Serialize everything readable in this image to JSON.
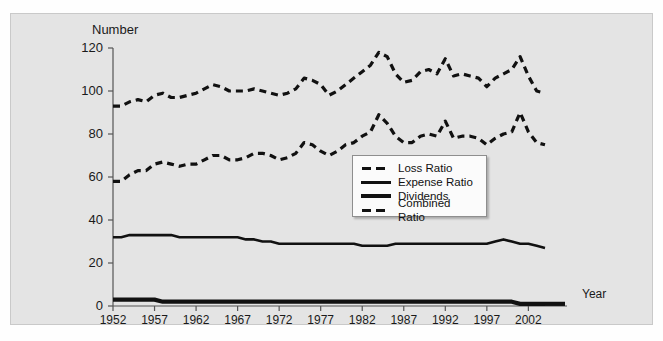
{
  "axes": {
    "y_title": "Number",
    "x_title": "Year",
    "yticks": [
      "0",
      "20",
      "40",
      "60",
      "80",
      "100",
      "120"
    ],
    "xticks": [
      "1952",
      "1957",
      "1962",
      "1967",
      "1972",
      "1977",
      "1982",
      "1987",
      "1992",
      "1997",
      "2002"
    ]
  },
  "legend": {
    "items": [
      {
        "label": "Loss Ratio",
        "key": "dashed"
      },
      {
        "label": "Expense Ratio",
        "key": "solid"
      },
      {
        "label": "Dividends",
        "key": "thick"
      },
      {
        "label": "Combined Ratio",
        "key": "dashed"
      }
    ]
  },
  "colors": {
    "ink": "#111111",
    "panel": "#e4e4e4",
    "legend_bg": "#fbfbfb",
    "axis": "#555555"
  },
  "chart_data": {
    "type": "line",
    "title": "",
    "xlabel": "Year",
    "ylabel": "Number",
    "ylim": [
      0,
      120
    ],
    "xlim": [
      1952,
      2004
    ],
    "grid": false,
    "legend_position": "center",
    "x": [
      1952,
      1953,
      1954,
      1955,
      1956,
      1957,
      1958,
      1959,
      1960,
      1961,
      1962,
      1963,
      1964,
      1965,
      1966,
      1967,
      1968,
      1969,
      1970,
      1971,
      1972,
      1973,
      1974,
      1975,
      1976,
      1977,
      1978,
      1979,
      1980,
      1981,
      1982,
      1983,
      1984,
      1985,
      1986,
      1987,
      1988,
      1989,
      1990,
      1991,
      1992,
      1993,
      1994,
      1995,
      1996,
      1997,
      1998,
      1999,
      2000,
      2001,
      2002,
      2003,
      2004
    ],
    "series": [
      {
        "name": "Combined Ratio",
        "style": "dashed",
        "values": [
          93,
          93,
          95,
          96,
          95,
          98,
          99,
          97,
          97,
          98,
          99,
          101,
          103,
          102,
          100,
          100,
          100,
          101,
          100,
          99,
          98,
          99,
          101,
          106,
          105,
          103,
          98,
          100,
          103,
          106,
          109,
          112,
          118,
          116,
          108,
          104,
          105,
          109,
          110,
          108,
          115,
          107,
          108,
          107,
          106,
          102,
          106,
          108,
          110,
          116,
          107,
          100,
          99
        ]
      },
      {
        "name": "Loss Ratio",
        "style": "dashed",
        "values": [
          58,
          58,
          61,
          63,
          63,
          66,
          67,
          66,
          65,
          66,
          66,
          68,
          70,
          70,
          68,
          68,
          69,
          71,
          71,
          70,
          68,
          69,
          71,
          76,
          75,
          72,
          70,
          72,
          75,
          76,
          79,
          81,
          89,
          85,
          79,
          76,
          76,
          79,
          80,
          79,
          86,
          78,
          79,
          79,
          78,
          75,
          78,
          80,
          81,
          90,
          81,
          76,
          75
        ]
      },
      {
        "name": "Expense Ratio",
        "style": "solid",
        "values": [
          32,
          32,
          33,
          33,
          33,
          33,
          33,
          33,
          32,
          32,
          32,
          32,
          32,
          32,
          32,
          32,
          31,
          31,
          30,
          30,
          29,
          29,
          29,
          29,
          29,
          29,
          29,
          29,
          29,
          29,
          28,
          28,
          28,
          28,
          29,
          29,
          29,
          29,
          29,
          29,
          29,
          29,
          29,
          29,
          29,
          29,
          30,
          31,
          30,
          29,
          29,
          28,
          27
        ]
      },
      {
        "name": "Dividends",
        "style": "thick",
        "values": [
          3,
          3,
          3,
          3,
          3,
          3,
          2,
          2,
          2,
          2,
          2,
          2,
          2,
          2,
          2,
          2,
          2,
          2,
          2,
          2,
          2,
          2,
          2,
          2,
          2,
          2,
          2,
          2,
          2,
          2,
          2,
          2,
          2,
          2,
          2,
          2,
          2,
          2,
          2,
          2,
          2,
          2,
          2,
          2,
          2,
          2,
          2,
          2,
          2,
          1,
          1,
          1,
          1
        ]
      }
    ]
  }
}
